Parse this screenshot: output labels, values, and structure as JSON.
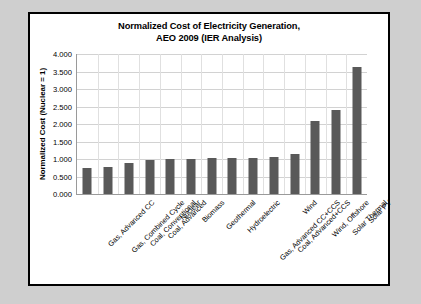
{
  "chart_data": {
    "type": "bar",
    "title": "Normalized Cost of Electricity Generation, AEO 2009 (IER Analysis)",
    "title_line1": "Normalized Cost of Electricity Generation,",
    "title_line2": "AEO 2009 (IER Analysis)",
    "xlabel": "",
    "ylabel": "Normalized Cost (Nuclear = 1)",
    "ylim": [
      0,
      4
    ],
    "ytick_step": 0.5,
    "ytick_labels": [
      "0.000",
      "0.500",
      "1.000",
      "1.500",
      "2.000",
      "2.500",
      "3.000",
      "3.500",
      "4.000"
    ],
    "ytick_values": [
      0,
      0.5,
      1,
      1.5,
      2,
      2.5,
      3,
      3.5,
      4
    ],
    "grid": true,
    "legend": null,
    "bar_color": "#595959",
    "plot_background": "#ffffff",
    "gridline_color": "#d2d2d2",
    "categories": [
      "Gas, Advanced CC",
      "Gas, Combined Cycle",
      "Coal, Conventional",
      "Coal, Advanced",
      "Nuclear",
      "Biomass",
      "Geothermal",
      "Hydroelectric",
      "Gas, Advanced CC+CCS",
      "Coal, Advanced+CCS",
      "Wind",
      "Wind, Offshore",
      "Solar Thermal",
      "Solar PV"
    ],
    "values": [
      0.73,
      0.78,
      0.9,
      0.98,
      1.0,
      1.01,
      1.02,
      1.02,
      1.03,
      1.06,
      1.15,
      2.08,
      2.4,
      3.63
    ]
  }
}
